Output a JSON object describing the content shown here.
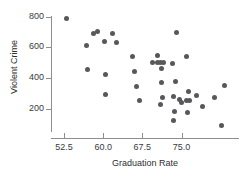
{
  "chart_data": {
    "type": "scatter",
    "title": "",
    "xlabel": "Graduation Rate",
    "ylabel": "Violent Crime",
    "xlim": [
      50.0,
      86.0
    ],
    "ylim": [
      60.0,
      830.0
    ],
    "xticks": [
      52.5,
      60.0,
      67.5,
      75.0
    ],
    "xtick_labels": [
      "52.5",
      "60.0",
      "67.5",
      "75.0"
    ],
    "yticks": [
      200,
      400,
      600,
      800
    ],
    "ytick_labels": [
      "200",
      "400",
      "600",
      "800"
    ],
    "grid": false,
    "legend": null,
    "marker_color": "#58585c",
    "axis_color": "#8e8e92",
    "points": [
      {
        "x": 52.9,
        "y": 785
      },
      {
        "x": 56.8,
        "y": 610
      },
      {
        "x": 57.0,
        "y": 455
      },
      {
        "x": 58.2,
        "y": 690
      },
      {
        "x": 58.9,
        "y": 700
      },
      {
        "x": 60.3,
        "y": 635
      },
      {
        "x": 60.4,
        "y": 423
      },
      {
        "x": 60.5,
        "y": 293
      },
      {
        "x": 61.8,
        "y": 688
      },
      {
        "x": 62.5,
        "y": 630
      },
      {
        "x": 65.6,
        "y": 540
      },
      {
        "x": 66.0,
        "y": 445
      },
      {
        "x": 66.4,
        "y": 345
      },
      {
        "x": 66.9,
        "y": 250
      },
      {
        "x": 69.5,
        "y": 500
      },
      {
        "x": 70.3,
        "y": 548
      },
      {
        "x": 70.4,
        "y": 500
      },
      {
        "x": 71.0,
        "y": 500
      },
      {
        "x": 71.6,
        "y": 500
      },
      {
        "x": 71.2,
        "y": 463
      },
      {
        "x": 71.1,
        "y": 373
      },
      {
        "x": 71.4,
        "y": 272
      },
      {
        "x": 70.9,
        "y": 227
      },
      {
        "x": 73.2,
        "y": 492
      },
      {
        "x": 74.0,
        "y": 695
      },
      {
        "x": 73.8,
        "y": 375
      },
      {
        "x": 73.4,
        "y": 278
      },
      {
        "x": 73.7,
        "y": 182
      },
      {
        "x": 73.5,
        "y": 122
      },
      {
        "x": 74.6,
        "y": 258
      },
      {
        "x": 75.0,
        "y": 240
      },
      {
        "x": 76.0,
        "y": 540
      },
      {
        "x": 76.3,
        "y": 310
      },
      {
        "x": 75.9,
        "y": 252
      },
      {
        "x": 76.6,
        "y": 250
      },
      {
        "x": 76.1,
        "y": 172
      },
      {
        "x": 77.8,
        "y": 288
      },
      {
        "x": 79.0,
        "y": 215
      },
      {
        "x": 81.3,
        "y": 275
      },
      {
        "x": 83.2,
        "y": 352
      },
      {
        "x": 82.6,
        "y": 90
      }
    ]
  }
}
